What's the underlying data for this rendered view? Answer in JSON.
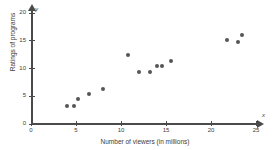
{
  "chart_data": {
    "type": "scatter",
    "title": "",
    "xlabel": "Number of viewers (in millions)",
    "ylabel": "Ratings of programs",
    "x_axis_variable": "x",
    "y_axis_variable": "y",
    "xlim": [
      0,
      25
    ],
    "ylim": [
      0,
      20
    ],
    "x_ticks": [
      0,
      5,
      10,
      15,
      20,
      25
    ],
    "y_ticks": [
      0,
      5,
      10,
      15,
      20
    ],
    "grid": false,
    "legend": null,
    "point_color": "#555555",
    "axis_color": "#4a4a4a",
    "background_color": "#ffffff",
    "points": [
      {
        "x": 4.0,
        "y": 3.2
      },
      {
        "x": 4.8,
        "y": 3.2
      },
      {
        "x": 5.2,
        "y": 4.4
      },
      {
        "x": 6.4,
        "y": 5.3
      },
      {
        "x": 8.0,
        "y": 6.2
      },
      {
        "x": 10.8,
        "y": 12.3
      },
      {
        "x": 12.0,
        "y": 9.3
      },
      {
        "x": 13.2,
        "y": 9.3
      },
      {
        "x": 14.0,
        "y": 10.3
      },
      {
        "x": 14.6,
        "y": 10.3
      },
      {
        "x": 15.5,
        "y": 11.3
      },
      {
        "x": 21.8,
        "y": 15.0
      },
      {
        "x": 23.0,
        "y": 14.7
      },
      {
        "x": 23.4,
        "y": 15.9
      }
    ]
  }
}
